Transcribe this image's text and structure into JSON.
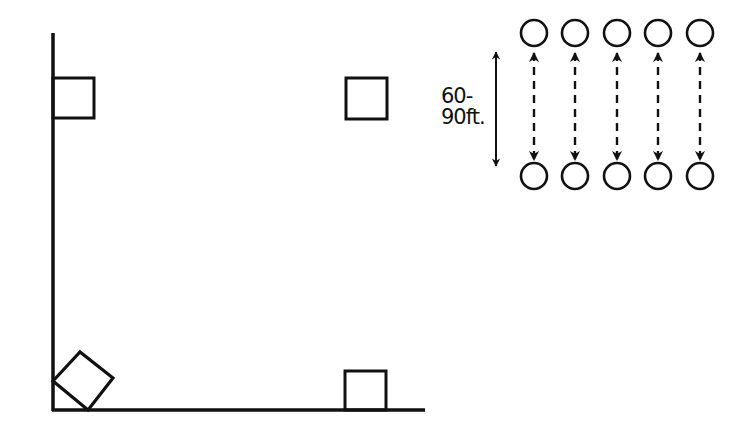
{
  "diagram": {
    "type": "baseball-field-drill",
    "colors": {
      "stroke": "#111111",
      "background": "#ffffff"
    },
    "field": {
      "foul_lines": {
        "vertex": [
          53,
          410
        ],
        "left_line_top_y": 33,
        "right_line_end_x": 425
      },
      "home_plate": {
        "points": "53,381 80,352 113,378 88,410"
      },
      "bases": [
        {
          "name": "first-base",
          "x": 345,
          "y": 371,
          "size": 41
        },
        {
          "name": "second-base",
          "x": 345,
          "y": 77,
          "size": 42
        },
        {
          "name": "third-base",
          "x": 53,
          "y": 78,
          "size": 41
        }
      ]
    },
    "drill": {
      "distance_label_line1": "60-",
      "distance_label_line2": "90ft.",
      "players_per_row": 5,
      "column_x": [
        534,
        575,
        617,
        658,
        700
      ],
      "top_row_y": 33,
      "bottom_row_y": 176,
      "circle_radius": 13,
      "measure_arrow": {
        "x": 496,
        "y1": 50,
        "y2": 168
      }
    }
  }
}
